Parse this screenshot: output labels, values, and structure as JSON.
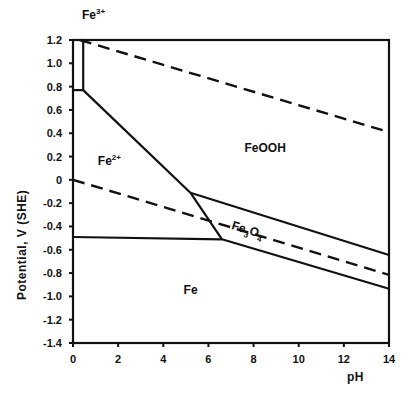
{
  "chart_data": {
    "type": "line",
    "title": "",
    "xlabel": "pH",
    "ylabel": "Potential, V (SHE)",
    "xlim": [
      0,
      14
    ],
    "ylim": [
      -1.4,
      1.2
    ],
    "x_ticks": [
      0,
      2,
      4,
      6,
      8,
      10,
      12,
      14
    ],
    "x_tick_labels": [
      "0",
      "2",
      "4",
      "6",
      "8",
      "10",
      "12",
      "14"
    ],
    "y_ticks": [
      1.2,
      1.0,
      0.8,
      0.6,
      0.4,
      0.2,
      0,
      -0.2,
      -0.4,
      -0.6,
      -0.8,
      -1.0,
      -1.2,
      -1.4
    ],
    "y_tick_labels": [
      "1.2",
      "1.0",
      "0.8",
      "0.6",
      "0.4",
      "0.2",
      "0",
      "-0.2",
      "-0.4",
      "-0.6",
      "-0.8",
      "-1.0",
      "-1.2",
      "-1.4"
    ],
    "grid": false,
    "series": [
      {
        "name": "Fe3+/Fe2+ boundary (vertical)",
        "style": "solid",
        "points": [
          [
            0.45,
            1.2
          ],
          [
            0.45,
            0.77
          ]
        ]
      },
      {
        "name": "Fe3+/Fe2+ boundary (horizontal)",
        "style": "solid",
        "points": [
          [
            0,
            0.77
          ],
          [
            0.45,
            0.77
          ]
        ]
      },
      {
        "name": "Fe2+/FeOOH boundary",
        "style": "solid",
        "points": [
          [
            0.45,
            0.77
          ],
          [
            5.2,
            -0.11
          ]
        ]
      },
      {
        "name": "Fe2+/Fe3O4 boundary",
        "style": "solid",
        "points": [
          [
            5.2,
            -0.11
          ],
          [
            6.6,
            -0.51
          ]
        ]
      },
      {
        "name": "Fe2+/Fe boundary",
        "style": "solid",
        "points": [
          [
            0,
            -0.49
          ],
          [
            6.6,
            -0.51
          ]
        ]
      },
      {
        "name": "FeOOH/Fe3O4 boundary",
        "style": "solid",
        "points": [
          [
            5.2,
            -0.11
          ],
          [
            14,
            -0.645
          ]
        ]
      },
      {
        "name": "Fe3O4/Fe boundary",
        "style": "solid",
        "points": [
          [
            6.6,
            -0.51
          ],
          [
            14,
            -0.935
          ]
        ]
      },
      {
        "name": "O2/H2O line",
        "style": "dashed",
        "points": [
          [
            0.3,
            1.2
          ],
          [
            14,
            0.41
          ]
        ]
      },
      {
        "name": "H2O/H2 line",
        "style": "dashed",
        "points": [
          [
            0,
            0
          ],
          [
            14,
            -0.815
          ]
        ]
      }
    ],
    "annotations": [
      {
        "text": "Fe",
        "sup": "3+",
        "x": 0.4,
        "y": 1.38
      },
      {
        "text": "FeOOH",
        "sup": "",
        "x": 7.6,
        "y": 0.24
      },
      {
        "text": "Fe",
        "sup": "2+",
        "x": 1.1,
        "y": 0.13
      },
      {
        "text": "Fe",
        "sub1": "3",
        "mid": "O",
        "sub2": "4",
        "x": 7.0,
        "y": -0.42,
        "rotated": true
      },
      {
        "text": "Fe",
        "sup": "",
        "x": 4.9,
        "y": -0.98
      }
    ]
  }
}
